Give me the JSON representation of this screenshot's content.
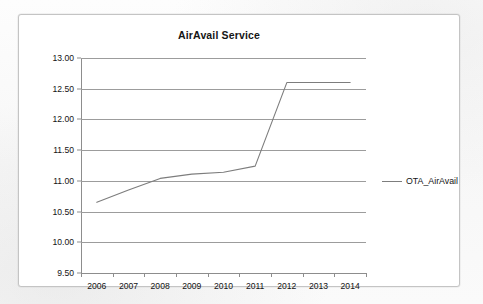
{
  "chart": {
    "title": "AirAvail Service",
    "frame": {
      "border_color": "#c4c4c4",
      "background": "#ffffff"
    }
  },
  "legend": {
    "position": "right",
    "entries": [
      {
        "label": "OTA_AirAvail",
        "color": "#7d7d7d",
        "marker": "line"
      }
    ]
  },
  "chart_data": {
    "type": "line",
    "title": "AirAvail Service",
    "xlabel": "",
    "ylabel": "",
    "categories": [
      "2006",
      "2007",
      "2008",
      "2009",
      "2010",
      "2011",
      "2012",
      "2013",
      "2014"
    ],
    "series": [
      {
        "name": "OTA_AirAvail",
        "color": "#7d7d7d",
        "values": [
          10.65,
          10.85,
          11.04,
          11.11,
          11.14,
          11.24,
          12.6,
          12.6,
          12.6
        ]
      }
    ],
    "ylim": [
      9.5,
      13.0
    ],
    "ytick_step": 0.5,
    "ytick_labels": [
      "13.00",
      "12.50",
      "12.00",
      "11.50",
      "11.00",
      "10.50",
      "10.00",
      "9.50"
    ],
    "ytick_values": [
      13.0,
      12.5,
      12.0,
      11.5,
      11.0,
      10.5,
      10.0,
      9.5
    ],
    "grid": true,
    "grid_axis": "y",
    "grid_color": "#9c9c9c",
    "legend_position": "right",
    "markers": false
  }
}
